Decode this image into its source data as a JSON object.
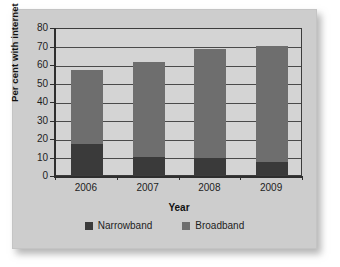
{
  "chart_data": {
    "type": "bar",
    "subtype": "stacked",
    "title": "",
    "xlabel": "Year",
    "ylabel": "Per cent with internet",
    "categories": [
      "2006",
      "2007",
      "2008",
      "2009"
    ],
    "series": [
      {
        "name": "Narrowband",
        "color": "#3a3a3a",
        "values": [
          17,
          10,
          9,
          7
        ]
      },
      {
        "name": "Broadband",
        "color": "#6e6e6e",
        "values": [
          40,
          51,
          59,
          63
        ]
      }
    ],
    "totals": [
      57,
      61,
      68,
      70
    ],
    "ylim": [
      0,
      80
    ],
    "ytick_step": 10,
    "yticks": [
      "0",
      "10",
      "20",
      "30",
      "40",
      "50",
      "60",
      "70",
      "80"
    ],
    "grid": true,
    "grid_axis": "y",
    "legend_position": "bottom",
    "plot_background": "#d4d4d4",
    "figure_background": "#cdcdcd"
  },
  "legend": {
    "items": [
      {
        "label": "Narrowband",
        "color": "#3a3a3a"
      },
      {
        "label": "Broadband",
        "color": "#6e6e6e"
      }
    ]
  }
}
